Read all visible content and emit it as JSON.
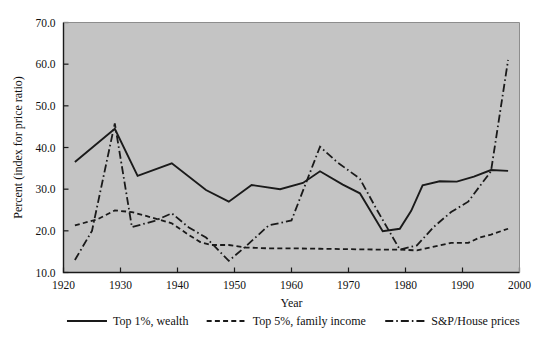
{
  "chart_data": {
    "type": "line",
    "title": "",
    "xlabel": "Year",
    "ylabel": "Percent (index for price ratio)",
    "xlim": [
      1920,
      2000
    ],
    "ylim": [
      10.0,
      70.0
    ],
    "xticks": [
      1920,
      1930,
      1940,
      1950,
      1960,
      1970,
      1980,
      1990,
      2000
    ],
    "xticklabels": [
      "1920",
      "1930",
      "1940",
      "1950",
      "1960",
      "1970",
      "1980",
      "1990",
      "2000"
    ],
    "yticks": [
      10.0,
      20.0,
      30.0,
      40.0,
      50.0,
      60.0,
      70.0
    ],
    "yticklabels": [
      "10.0",
      "20.0",
      "30.0",
      "40.0",
      "50.0",
      "60.0",
      "70.0"
    ],
    "grid": false,
    "legend_position": "below-axes",
    "plot_background": "#c4c4c4",
    "line_color": "#1a1a1a",
    "series": [
      {
        "name": "Top 1%, wealth",
        "style": "solid",
        "points": [
          [
            1922,
            36.5
          ],
          [
            1929,
            44.5
          ],
          [
            1933,
            33.2
          ],
          [
            1939,
            36.2
          ],
          [
            1945,
            29.8
          ],
          [
            1949,
            27.0
          ],
          [
            1953,
            31.0
          ],
          [
            1958,
            30.0
          ],
          [
            1962,
            31.5
          ],
          [
            1965,
            34.3
          ],
          [
            1969,
            31.1
          ],
          [
            1972,
            29.0
          ],
          [
            1976,
            19.9
          ],
          [
            1979,
            20.5
          ],
          [
            1981,
            24.8
          ],
          [
            1983,
            30.9
          ],
          [
            1986,
            31.9
          ],
          [
            1989,
            31.8
          ],
          [
            1992,
            33.0
          ],
          [
            1995,
            34.6
          ],
          [
            1998,
            34.4
          ]
        ]
      },
      {
        "name": "Top 5%, family income",
        "style": "dashed",
        "points": [
          [
            1922,
            21.3
          ],
          [
            1926,
            22.8
          ],
          [
            1929,
            24.9
          ],
          [
            1932,
            24.5
          ],
          [
            1936,
            23.0
          ],
          [
            1939,
            21.8
          ],
          [
            1942,
            19.0
          ],
          [
            1944,
            17.3
          ],
          [
            1946,
            16.6
          ],
          [
            1949,
            16.6
          ],
          [
            1952,
            16.0
          ],
          [
            1956,
            15.8
          ],
          [
            1960,
            15.8
          ],
          [
            1965,
            15.7
          ],
          [
            1970,
            15.6
          ],
          [
            1975,
            15.5
          ],
          [
            1979,
            15.5
          ],
          [
            1982,
            15.3
          ],
          [
            1985,
            16.2
          ],
          [
            1988,
            17.1
          ],
          [
            1991,
            17.1
          ],
          [
            1993,
            18.4
          ],
          [
            1995,
            19.1
          ],
          [
            1998,
            20.5
          ]
        ]
      },
      {
        "name": "S&P/House prices",
        "style": "dashdot",
        "points": [
          [
            1922,
            13.0
          ],
          [
            1925,
            20.0
          ],
          [
            1929,
            45.8
          ],
          [
            1932,
            20.9
          ],
          [
            1936,
            22.4
          ],
          [
            1939,
            24.2
          ],
          [
            1942,
            20.8
          ],
          [
            1945,
            18.4
          ],
          [
            1949,
            12.8
          ],
          [
            1952,
            16.3
          ],
          [
            1956,
            21.3
          ],
          [
            1960,
            22.5
          ],
          [
            1965,
            40.2
          ],
          [
            1968,
            36.5
          ],
          [
            1972,
            32.5
          ],
          [
            1975,
            25.0
          ],
          [
            1979,
            15.5
          ],
          [
            1982,
            16.5
          ],
          [
            1985,
            21.0
          ],
          [
            1988,
            24.5
          ],
          [
            1991,
            27.0
          ],
          [
            1995,
            34.3
          ],
          [
            1998,
            61.0
          ]
        ]
      }
    ]
  },
  "legend": {
    "items": [
      {
        "label": "Top 1%, wealth",
        "style": "solid"
      },
      {
        "label": "Top 5%, family income",
        "style": "dashed"
      },
      {
        "label": "S&P/House prices",
        "style": "dashdot"
      }
    ]
  }
}
